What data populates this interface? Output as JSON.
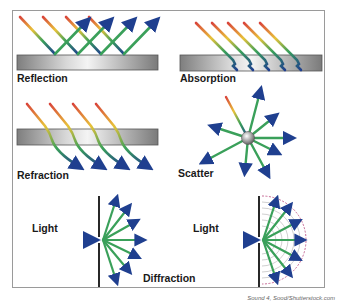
{
  "panels": {
    "reflection": {
      "label": "Reflection"
    },
    "absorption": {
      "label": "Absorption"
    },
    "refraction": {
      "label": "Refraction"
    },
    "scatter": {
      "label": "Scatter"
    },
    "diffraction": {
      "label": "Diffraction",
      "left_light_label": "Light",
      "right_light_label": "Light"
    }
  },
  "credit": "Sound 4, Sood/Shutterstock.com",
  "colors": {
    "ray_start": "#d9453a",
    "ray_mid1": "#e8c23a",
    "ray_mid2": "#3aa05a",
    "ray_end": "#1f3f8f",
    "slab_dark": "#8a8a8a",
    "slab_light": "#f2f2f2"
  }
}
